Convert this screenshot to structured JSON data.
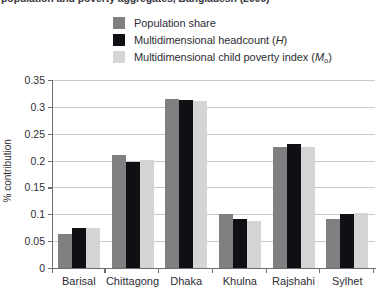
{
  "figure": {
    "title": "population and poverty aggregates, Bangladesh (2006)",
    "ylabel": "% contribution"
  },
  "legend": {
    "items": [
      {
        "label": "Population share",
        "color": "#808083"
      },
      {
        "label": "Multidimensional headcount (H)",
        "color": "#101014"
      },
      {
        "label": "Multidimensional child poverty index (M0)",
        "color": "#d5d5d5"
      }
    ]
  },
  "axis": {
    "yticks": [
      "0",
      "0.05",
      "0.1",
      "0.15",
      "0.2",
      "0.25",
      "0.3",
      "0.35"
    ]
  },
  "chart_data": {
    "type": "bar",
    "title": "population and poverty aggregates, Bangladesh (2006)",
    "xlabel": "",
    "ylabel": "% contribution",
    "ylim": [
      0,
      0.35
    ],
    "ytick_step": 0.05,
    "grid": true,
    "legend_position": "top-center",
    "categories": [
      "Barisal",
      "Chittagong",
      "Dhaka",
      "Khulna",
      "Rajshahi",
      "Sylhet"
    ],
    "series": [
      {
        "name": "Population share",
        "color": "#808083",
        "values": [
          0.063,
          0.211,
          0.315,
          0.101,
          0.226,
          0.091
        ]
      },
      {
        "name": "Multidimensional headcount (H)",
        "color": "#101014",
        "values": [
          0.075,
          0.198,
          0.313,
          0.091,
          0.231,
          0.1
        ]
      },
      {
        "name": "Multidimensional child poverty index (M0)",
        "color": "#d5d5d5",
        "values": [
          0.074,
          0.202,
          0.311,
          0.087,
          0.226,
          0.103
        ]
      }
    ]
  }
}
